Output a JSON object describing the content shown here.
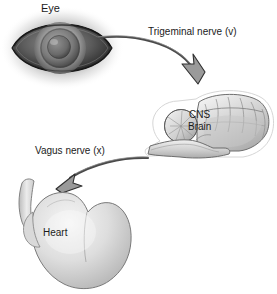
{
  "figure": {
    "background_color": "#ffffff"
  },
  "nodes": {
    "eye": {
      "label": "Eye",
      "kind": "organ-illustration"
    },
    "brain": {
      "label_line1": "CNS",
      "label_line2": "Brain",
      "kind": "organ-illustration"
    },
    "heart": {
      "label": "Heart",
      "kind": "organ-illustration"
    }
  },
  "connectors": {
    "trigeminal": {
      "label": "Trigeminal nerve (v)",
      "from": "eye",
      "to": "brain",
      "direction": "afferent"
    },
    "vagus": {
      "label": "Vagus nerve (x)",
      "from": "brain",
      "to": "heart",
      "direction": "efferent"
    }
  },
  "colors": {
    "text": "#1b1b1b",
    "arrow_stroke": "#4a4a4a",
    "arrow_fill": "#9a9a9a",
    "organ_outline": "#6e6e6e",
    "organ_fill_light": "#e8e8e8",
    "organ_fill_mid": "#c4c4c4",
    "eye_dark": "#2a2a2a"
  }
}
